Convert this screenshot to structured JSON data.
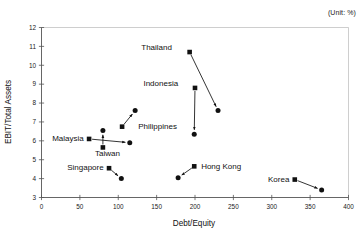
{
  "unit_note": "(Unit: %)",
  "chart_data": {
    "type": "scatter",
    "title": "",
    "subtitle": "",
    "xlabel": "Debt/Equity",
    "ylabel": "EBIT/Total Assets",
    "xlim": [
      0,
      400
    ],
    "ylim": [
      3,
      12
    ],
    "xticks": [
      0,
      50,
      100,
      150,
      200,
      250,
      300,
      350,
      400
    ],
    "yticks": [
      3,
      4,
      5,
      6,
      7,
      8,
      9,
      10,
      11,
      12
    ],
    "xtick_labels": [
      "0",
      "50",
      "100",
      "150",
      "200",
      "250",
      "300",
      "350",
      "400"
    ],
    "ytick_labels": [
      "3",
      "4",
      "5",
      "6",
      "7",
      "8",
      "9",
      "10",
      "11",
      "12"
    ],
    "grid": false,
    "legend": "none",
    "annotation": "(Unit: %)",
    "marker_start": "filled-square",
    "marker_end": "filled-circle",
    "connector": "arrow-from-start-to-end",
    "series": [
      {
        "name": "Thailand",
        "label": "Thailand",
        "start": {
          "x": 193,
          "y": 10.7
        },
        "end": {
          "x": 230,
          "y": 7.6
        },
        "label_pos": {
          "x": 170,
          "y": 10.95,
          "anchor": "end"
        }
      },
      {
        "name": "Indonesia",
        "label": "Indonesia",
        "start": {
          "x": 200,
          "y": 8.8
        },
        "end": {
          "x": 199,
          "y": 6.35
        },
        "label_pos": {
          "x": 178,
          "y": 9.05,
          "anchor": "end"
        }
      },
      {
        "name": "Philippines",
        "label": "Philippines",
        "start": {
          "x": 105,
          "y": 6.75
        },
        "end": {
          "x": 122,
          "y": 7.6
        },
        "label_pos": {
          "x": 126,
          "y": 6.8,
          "anchor": "start"
        }
      },
      {
        "name": "Malaysia",
        "label": "Malaysia",
        "start": {
          "x": 62,
          "y": 6.1
        },
        "end": {
          "x": 115,
          "y": 5.9
        },
        "label_pos": {
          "x": 55,
          "y": 6.15,
          "anchor": "end"
        }
      },
      {
        "name": "Taiwan",
        "label": "Taiwan",
        "start": {
          "x": 80,
          "y": 5.65
        },
        "end": {
          "x": 80,
          "y": 6.55
        },
        "label_pos": {
          "x": 86,
          "y": 5.38,
          "anchor": "middle"
        }
      },
      {
        "name": "Singapore",
        "label": "Singapore",
        "start": {
          "x": 88,
          "y": 4.55
        },
        "end": {
          "x": 104,
          "y": 4.0
        },
        "label_pos": {
          "x": 81,
          "y": 4.6,
          "anchor": "end"
        }
      },
      {
        "name": "Hong Kong",
        "label": "Hong Kong",
        "start": {
          "x": 199,
          "y": 4.65
        },
        "end": {
          "x": 178,
          "y": 4.05
        },
        "label_pos": {
          "x": 208,
          "y": 4.68,
          "anchor": "start"
        }
      },
      {
        "name": "Korea",
        "label": "Korea",
        "start": {
          "x": 330,
          "y": 3.95
        },
        "end": {
          "x": 365,
          "y": 3.4
        },
        "label_pos": {
          "x": 323,
          "y": 4.0,
          "anchor": "end"
        }
      }
    ]
  }
}
